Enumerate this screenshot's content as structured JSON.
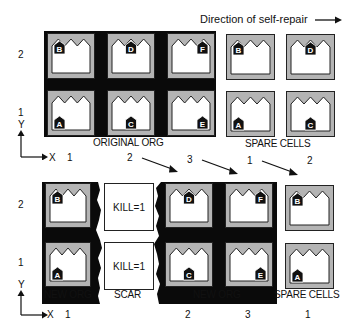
{
  "title": "Direction of self-repair",
  "colors": {
    "frame": "#0a0a0a",
    "cell_fill": "#b4b4b4",
    "cell_body": "#ffffff",
    "tag": "#111111"
  },
  "top": {
    "row_labels": [
      "2",
      "1"
    ],
    "axis": {
      "y": "Y",
      "x": "X"
    },
    "col_labels": [
      "1",
      "2",
      "3",
      "1",
      "2"
    ],
    "captions": {
      "original": "ORIGINAL ORG",
      "spare": "SPARE CELLS"
    },
    "original_cells": [
      {
        "letter": "B",
        "pos": "left",
        "row": 2,
        "col": 1
      },
      {
        "letter": "D",
        "pos": "center",
        "row": 2,
        "col": 2
      },
      {
        "letter": "F",
        "pos": "right",
        "row": 2,
        "col": 3
      },
      {
        "letter": "A",
        "pos": "left",
        "row": 1,
        "col": 1
      },
      {
        "letter": "C",
        "pos": "center",
        "row": 1,
        "col": 2
      },
      {
        "letter": "E",
        "pos": "right",
        "row": 1,
        "col": 3
      }
    ],
    "spare_cells": [
      {
        "letter": "B",
        "pos": "left",
        "row": 2,
        "col": 1
      },
      {
        "letter": "D",
        "pos": "center",
        "row": 2,
        "col": 2
      },
      {
        "letter": "A",
        "pos": "left",
        "row": 1,
        "col": 1
      },
      {
        "letter": "C",
        "pos": "center",
        "row": 1,
        "col": 2
      }
    ]
  },
  "bottom": {
    "row_labels": [
      "2",
      "1"
    ],
    "axis": {
      "y": "Y",
      "x": "X"
    },
    "col_labels": [
      "1",
      "2",
      "3",
      "1"
    ],
    "captions": {
      "new_org_left": "NEW ORG",
      "scar": "SCAR",
      "new_org_right": "NEW ORG",
      "spare": "SPARE CELLS"
    },
    "scar_cells": [
      {
        "text": "KILL=1"
      },
      {
        "text": "KILL=1"
      }
    ],
    "left_cells": [
      {
        "letter": "B",
        "pos": "left"
      },
      {
        "letter": "A",
        "pos": "left"
      }
    ],
    "right_cells": [
      {
        "letter": "D",
        "pos": "center"
      },
      {
        "letter": "F",
        "pos": "right"
      },
      {
        "letter": "C",
        "pos": "center"
      },
      {
        "letter": "E",
        "pos": "right"
      }
    ],
    "spare_cells": [
      {
        "letter": "B",
        "pos": "left"
      },
      {
        "letter": "A",
        "pos": "left"
      }
    ]
  }
}
